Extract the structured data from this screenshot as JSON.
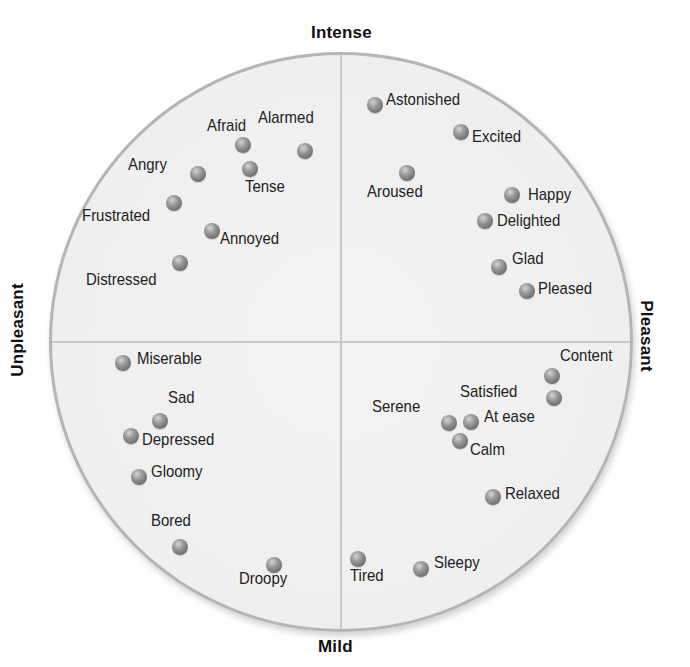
{
  "chart_data": {
    "type": "scatter",
    "title": "",
    "axes": {
      "top": "Intense",
      "bottom": "Mild",
      "left": "Unpleasant",
      "right": "Pleasant"
    },
    "xlabel": "Unpleasant — Pleasant",
    "ylabel": "Mild — Intense",
    "xlim": [
      -1,
      1
    ],
    "ylim": [
      -1,
      1
    ],
    "grid": false,
    "points": [
      {
        "label": "Afraid",
        "x": -0.34,
        "y": 0.67
      },
      {
        "label": "Alarmed",
        "x": -0.12,
        "y": 0.65
      },
      {
        "label": "Angry",
        "x": -0.49,
        "y": 0.57
      },
      {
        "label": "Tense",
        "x": -0.31,
        "y": 0.59
      },
      {
        "label": "Frustrated",
        "x": -0.57,
        "y": 0.48
      },
      {
        "label": "Annoyed",
        "x": -0.44,
        "y": 0.38
      },
      {
        "label": "Distressed",
        "x": -0.55,
        "y": 0.27
      },
      {
        "label": "Astonished",
        "x": 0.12,
        "y": 0.81
      },
      {
        "label": "Excited",
        "x": 0.41,
        "y": 0.72
      },
      {
        "label": "Aroused",
        "x": 0.23,
        "y": 0.58
      },
      {
        "label": "Happy",
        "x": 0.59,
        "y": 0.5
      },
      {
        "label": "Delighted",
        "x": 0.49,
        "y": 0.41
      },
      {
        "label": "Glad",
        "x": 0.54,
        "y": 0.26
      },
      {
        "label": "Pleased",
        "x": 0.64,
        "y": 0.17
      },
      {
        "label": "Miserable",
        "x": -0.75,
        "y": -0.07
      },
      {
        "label": "Sad",
        "x": -0.62,
        "y": -0.27
      },
      {
        "label": "Depressed",
        "x": -0.72,
        "y": -0.32
      },
      {
        "label": "Gloomy",
        "x": -0.69,
        "y": -0.46
      },
      {
        "label": "Bored",
        "x": -0.55,
        "y": -0.7
      },
      {
        "label": "Droopy",
        "x": -0.23,
        "y": -0.76
      },
      {
        "label": "Content",
        "x": 0.72,
        "y": -0.12
      },
      {
        "label": "Satisfied",
        "x": 0.73,
        "y": -0.19
      },
      {
        "label": "Serene",
        "x": 0.37,
        "y": -0.28
      },
      {
        "label": "At ease",
        "x": 0.45,
        "y": -0.27
      },
      {
        "label": "Calm",
        "x": 0.41,
        "y": -0.34
      },
      {
        "label": "Relaxed",
        "x": 0.52,
        "y": -0.53
      },
      {
        "label": "Tired",
        "x": 0.06,
        "y": -0.74
      },
      {
        "label": "Sleepy",
        "x": 0.27,
        "y": -0.78
      }
    ]
  },
  "axes": {
    "top": "Intense",
    "bottom": "Mild",
    "left": "Unpleasant",
    "right": "Pleasant"
  },
  "colors": {
    "circle_fill": "#efefef",
    "circle_edge": "#b5b5b5",
    "axis_line": "#c9c9c9",
    "dot": "#7a7a7a",
    "text": "#222222"
  },
  "emotions": [
    {
      "label": "Afraid",
      "dot": [
        243,
        145
      ],
      "text": [
        207,
        116
      ]
    },
    {
      "label": "Alarmed",
      "dot": [
        305,
        151
      ],
      "text": [
        258,
        108
      ]
    },
    {
      "label": "Angry",
      "dot": [
        198,
        174
      ],
      "text": [
        128,
        155
      ]
    },
    {
      "label": "Tense",
      "dot": [
        250,
        169
      ],
      "text": [
        245,
        177
      ]
    },
    {
      "label": "Frustrated",
      "dot": [
        174,
        203
      ],
      "text": [
        82,
        206
      ]
    },
    {
      "label": "Annoyed",
      "dot": [
        212,
        231
      ],
      "text": [
        220,
        229
      ]
    },
    {
      "label": "Distressed",
      "dot": [
        180,
        263
      ],
      "text": [
        86,
        270
      ]
    },
    {
      "label": "Astonished",
      "dot": [
        375,
        105
      ],
      "text": [
        386,
        90
      ]
    },
    {
      "label": "Excited",
      "dot": [
        461,
        132
      ],
      "text": [
        472,
        127
      ]
    },
    {
      "label": "Aroused",
      "dot": [
        407,
        173
      ],
      "text": [
        367,
        182
      ]
    },
    {
      "label": "Happy",
      "dot": [
        512,
        195
      ],
      "text": [
        528,
        185
      ]
    },
    {
      "label": "Delighted",
      "dot": [
        485,
        221
      ],
      "text": [
        497,
        211
      ]
    },
    {
      "label": "Glad",
      "dot": [
        499,
        267
      ],
      "text": [
        512,
        249
      ]
    },
    {
      "label": "Pleased",
      "dot": [
        527,
        291
      ],
      "text": [
        538,
        279
      ]
    },
    {
      "label": "Miserable",
      "dot": [
        123,
        363
      ],
      "text": [
        137,
        349
      ]
    },
    {
      "label": "Sad",
      "dot": [
        160,
        421
      ],
      "text": [
        168,
        388
      ]
    },
    {
      "label": "Depressed",
      "dot": [
        131,
        436
      ],
      "text": [
        142,
        430
      ]
    },
    {
      "label": "Gloomy",
      "dot": [
        139,
        477
      ],
      "text": [
        151,
        462
      ]
    },
    {
      "label": "Bored",
      "dot": [
        180,
        547
      ],
      "text": [
        151,
        511
      ]
    },
    {
      "label": "Droopy",
      "dot": [
        274,
        565
      ],
      "text": [
        239,
        569
      ]
    },
    {
      "label": "Content",
      "dot": [
        552,
        376
      ],
      "text": [
        560,
        346
      ]
    },
    {
      "label": "Satisfied",
      "dot": [
        554,
        398
      ],
      "text": [
        460,
        382
      ]
    },
    {
      "label": "Serene",
      "dot": [
        449,
        423
      ],
      "text": [
        372,
        397
      ]
    },
    {
      "label": "At ease",
      "dot": [
        471,
        422
      ],
      "text": [
        484,
        407
      ]
    },
    {
      "label": "Calm",
      "dot": [
        460,
        441
      ],
      "text": [
        470,
        440
      ]
    },
    {
      "label": "Relaxed",
      "dot": [
        493,
        497
      ],
      "text": [
        505,
        484
      ]
    },
    {
      "label": "Tired",
      "dot": [
        358,
        559
      ],
      "text": [
        350,
        566
      ]
    },
    {
      "label": "Sleepy",
      "dot": [
        421,
        569
      ],
      "text": [
        434,
        553
      ]
    }
  ]
}
